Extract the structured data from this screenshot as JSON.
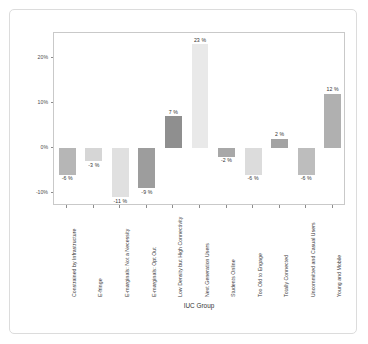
{
  "chart_data": {
    "type": "bar",
    "title": "",
    "subtitle": "",
    "xlabel": "IUC Group",
    "ylabel": "Difference from National Average",
    "categories": [
      "Constrained by Infrastructure",
      "E-fringe",
      "E-marginals: Not a Necessity",
      "E-marginals: Opt Out",
      "Low Density but High Connectivity",
      "Next Generation Users",
      "Students Online",
      "Too Old to Engage",
      "Totally Connected",
      "Uncommitted and Casual Users",
      "Young and Mobile"
    ],
    "values": [
      -6,
      -3,
      -11,
      -9,
      7,
      23,
      -2,
      -6,
      2,
      -6,
      12
    ],
    "value_labels": [
      "-6 %",
      "-3 %",
      "-11 %",
      "-9 %",
      "7 %",
      "23 %",
      "-2 %",
      "-6 %",
      "2 %",
      "-6 %",
      "12 %"
    ],
    "bar_colors": [
      "#b6b6b6",
      "#d6d6d6",
      "#e0e0e0",
      "#9d9d9d",
      "#8f8f8f",
      "#e9e9e9",
      "#a8a8a8",
      "#dcdcdc",
      "#a3a3a3",
      "#bdbdbd",
      "#b0b0b0"
    ],
    "ylim": [
      -13,
      25.5
    ],
    "ytick_values": [
      20,
      10,
      0,
      -10
    ],
    "ytick_labels": [
      "20%",
      "10%",
      "0%",
      "-10%"
    ],
    "grid": false,
    "legend": null,
    "panel_background": "#ffffff",
    "panel_border_color": "#c9c9c9",
    "axis_text_color": "#4d4d4d"
  }
}
